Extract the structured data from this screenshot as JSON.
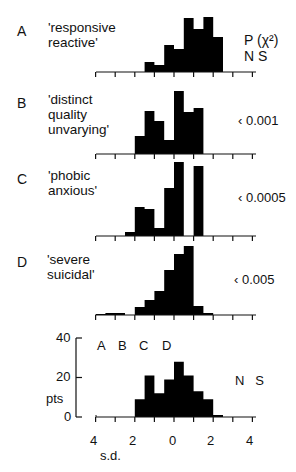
{
  "chart_data": [
    {
      "type": "bar",
      "panel": "A",
      "label": "'responsive reactive'",
      "label_lines": [
        "'responsive",
        "reactive'"
      ],
      "p_value": "NS",
      "bin_width_sd": 0.5,
      "x_start": -1.5,
      "values": [
        10,
        7,
        27,
        23,
        54,
        43,
        55,
        35
      ],
      "unit": "px-height (relative)"
    },
    {
      "type": "bar",
      "panel": "B",
      "label": "'distinct quality unvarying'",
      "label_lines": [
        "'distinct",
        "quality",
        "unvarying'"
      ],
      "p_value": "<0.001",
      "bin_width_sd": 0.5,
      "x_start": -2.0,
      "values": [
        18,
        43,
        33,
        14,
        63,
        42,
        46
      ]
    },
    {
      "type": "bar",
      "panel": "C",
      "label": "'phobic anxious'",
      "label_lines": [
        "'phobic",
        "anxious'"
      ],
      "p_value": "<0.0005",
      "bin_width_sd": 0.5,
      "x_start": -2.5,
      "values": [
        4,
        29,
        27,
        8,
        48,
        74,
        0,
        70
      ]
    },
    {
      "type": "bar",
      "panel": "D",
      "label": "'severe suicidal'",
      "label_lines": [
        "'severe",
        "suicidal'"
      ],
      "p_value": "<0.005",
      "bin_width_sd": 0.5,
      "x_start": -4.0,
      "values": [
        1,
        2,
        2,
        0,
        8,
        15,
        24,
        45,
        61,
        69,
        9,
        2
      ]
    },
    {
      "type": "bar",
      "panel": "total",
      "title": "",
      "xlabel": "s.d.",
      "ylabel": "pts",
      "ylim": [
        0,
        40
      ],
      "yticks": [
        0,
        20,
        40
      ],
      "xticks": [
        "4",
        "2",
        "0",
        "2",
        "4"
      ],
      "xlim": [
        -4,
        4
      ],
      "bin_width_sd": 0.5,
      "x_start": -2.0,
      "values": [
        9,
        21,
        12,
        19,
        28,
        21,
        13,
        9,
        1
      ],
      "p_value": "NS",
      "annotations": [
        "A",
        "B",
        "C",
        "D"
      ]
    }
  ],
  "header": {
    "p_label": "P (χ²)",
    "p_first": "N S"
  },
  "panels": [
    {
      "letter": "A",
      "lines": [
        "'responsive",
        "reactive'"
      ],
      "p": ""
    },
    {
      "letter": "B",
      "lines": [
        "'distinct",
        "quality",
        "unvarying'"
      ],
      "p": "‹ 0.001"
    },
    {
      "letter": "C",
      "lines": [
        "'phobic",
        "anxious'"
      ],
      "p": "‹ 0.0005"
    },
    {
      "letter": "D",
      "lines": [
        "'severe",
        "suicidal'"
      ],
      "p": "‹ 0.005"
    }
  ],
  "total": {
    "ylabel": "pts",
    "xlabel": "s.d.",
    "yticks": [
      "40",
      "20",
      "0"
    ],
    "xticks": [
      "4",
      "2",
      "0",
      "2",
      "4"
    ],
    "abcd": [
      "A",
      "B",
      "C",
      "D"
    ],
    "p": "N   S"
  }
}
